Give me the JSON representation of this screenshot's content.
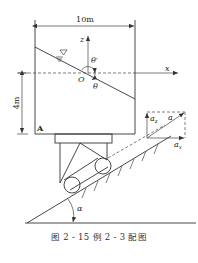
{
  "figure": {
    "caption": "图 2 - 15   例 2 - 3 配图",
    "labels": {
      "width_dim": "10m",
      "height_dim": "4m",
      "z_axis": "z",
      "x_axis": "x",
      "origin": "O",
      "theta_prime": "θ′",
      "theta": "θ",
      "point_a": "A",
      "accel": "a",
      "accel_z": "a",
      "accel_z_sub": "z",
      "accel_x": "a",
      "accel_x_sub": "x",
      "incline_angle": "α",
      "free_surface_symbol": "∇"
    }
  }
}
